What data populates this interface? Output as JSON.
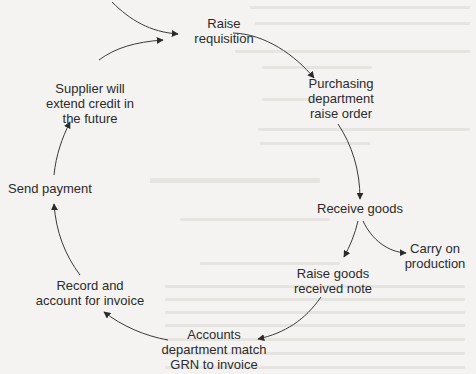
{
  "diagram": {
    "type": "cycle-flowchart",
    "colors": {
      "background": "#f4f3f1",
      "line": "#3a3a3a",
      "text": "#2b2b2b"
    },
    "nodes": [
      {
        "id": "raise-requisition",
        "lines": [
          "Raise",
          "requisition"
        ]
      },
      {
        "id": "purchasing-order",
        "lines": [
          "Purchasing",
          "department",
          "raise order"
        ]
      },
      {
        "id": "receive-goods",
        "lines": [
          "Receive goods"
        ]
      },
      {
        "id": "carry-on-production",
        "lines": [
          "Carry on",
          "production"
        ]
      },
      {
        "id": "raise-grn",
        "lines": [
          "Raise goods",
          "received note"
        ]
      },
      {
        "id": "accounts-match",
        "lines": [
          "Accounts",
          "department match",
          "GRN to invoice"
        ]
      },
      {
        "id": "record-invoice",
        "lines": [
          "Record and",
          "account for invoice"
        ]
      },
      {
        "id": "send-payment",
        "lines": [
          "Send payment"
        ]
      },
      {
        "id": "supplier-credit",
        "lines": [
          "Supplier will",
          "extend credit in",
          "the future"
        ]
      }
    ],
    "edges": [
      {
        "from": "(entry)",
        "to": "raise-requisition"
      },
      {
        "from": "raise-requisition",
        "to": "purchasing-order"
      },
      {
        "from": "purchasing-order",
        "to": "receive-goods"
      },
      {
        "from": "receive-goods",
        "to": "raise-grn"
      },
      {
        "from": "receive-goods",
        "to": "carry-on-production"
      },
      {
        "from": "raise-grn",
        "to": "accounts-match"
      },
      {
        "from": "accounts-match",
        "to": "record-invoice"
      },
      {
        "from": "record-invoice",
        "to": "send-payment"
      },
      {
        "from": "send-payment",
        "to": "supplier-credit"
      },
      {
        "from": "supplier-credit",
        "to": "raise-requisition"
      }
    ]
  }
}
